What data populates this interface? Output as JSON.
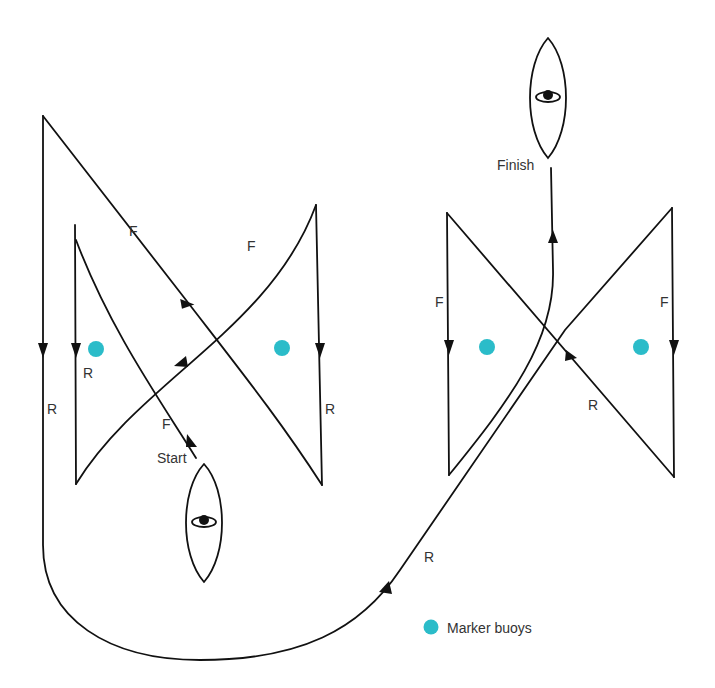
{
  "diagram": {
    "type": "boat manoeuvring course (figure-of-eight / reverse exercise)",
    "labels": {
      "start": "Start",
      "finish": "Finish",
      "forward": "F",
      "reverse": "R"
    },
    "legend": {
      "buoy_label": "Marker buoys",
      "buoy_color": "#2bbcc9"
    },
    "buoys": [
      {
        "x": 96,
        "y": 349
      },
      {
        "x": 282,
        "y": 348
      },
      {
        "x": 487,
        "y": 347
      },
      {
        "x": 641,
        "y": 347
      }
    ],
    "boats": [
      {
        "role": "start",
        "cx": 204,
        "cy": 522
      },
      {
        "role": "finish",
        "cx": 548,
        "cy": 97
      }
    ],
    "segment_labels": [
      {
        "text": "F",
        "x": 130,
        "y": 236
      },
      {
        "text": "F",
        "x": 247,
        "y": 250
      },
      {
        "text": "R",
        "x": 83,
        "y": 377
      },
      {
        "text": "R",
        "x": 48,
        "y": 413
      },
      {
        "text": "F",
        "x": 162,
        "y": 428
      },
      {
        "text": "R",
        "x": 325,
        "y": 412
      },
      {
        "text": "F",
        "x": 436,
        "y": 306
      },
      {
        "text": "F",
        "x": 660,
        "y": 306
      },
      {
        "text": "R",
        "x": 588,
        "y": 409
      },
      {
        "text": "R",
        "x": 425,
        "y": 561
      }
    ],
    "colors": {
      "line": "#111111",
      "text": "#333333",
      "buoy": "#2bbcc9",
      "background": "#ffffff"
    }
  }
}
